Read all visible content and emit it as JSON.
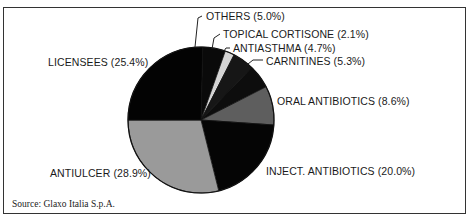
{
  "chart_data": {
    "type": "pie",
    "title": "",
    "slices": [
      {
        "label": "OTHERS",
        "value": 5.0,
        "color": "#0a0a0a"
      },
      {
        "label": "TOPICAL CORTISONE",
        "value": 2.1,
        "color": "#d4d4d4"
      },
      {
        "label": "ANTIASTHMA",
        "value": 4.7,
        "color": "#161616"
      },
      {
        "label": "CARNITINES",
        "value": 5.3,
        "color": "#0d0d0d"
      },
      {
        "label": "ORAL ANTIBIOTICS",
        "value": 8.6,
        "color": "#5e5e5e"
      },
      {
        "label": "INJECT. ANTIBIOTICS",
        "value": 20.0,
        "color": "#050505"
      },
      {
        "label": "ANTIULCER",
        "value": 28.9,
        "color": "#9a9a9a"
      },
      {
        "label": "LICENSEES",
        "value": 25.4,
        "color": "#030303"
      }
    ],
    "source": "Source: Glaxo Italia S.p.A."
  },
  "labels": {
    "others": "OTHERS (5.0%)",
    "topical": "TOPICAL CORTISONE (2.1%)",
    "antiasthma": "ANTIASTHMA (4.7%)",
    "carnitines": "CARNITINES (5.3%)",
    "oral": "ORAL ANTIBIOTICS (8.6%)",
    "inject": "INJECT. ANTIBIOTICS (20.0%)",
    "antiulcer": "ANTIULCER (28.9%)",
    "licensees": "LICENSEES (25.4%)"
  },
  "footer": {
    "source": "Source: Glaxo Italia S.p.A."
  }
}
